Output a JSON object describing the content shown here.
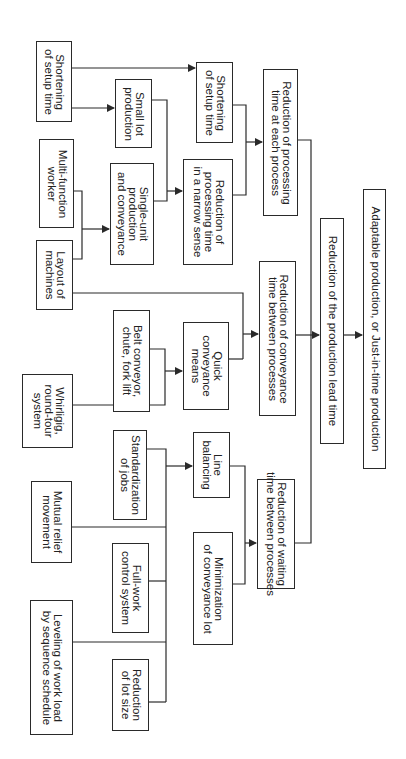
{
  "diagram": {
    "orientation": "rotated-90-clockwise",
    "title": "",
    "colors": {
      "line": "#2a2a2a",
      "text": "#222222",
      "background": "#ffffff"
    },
    "nodes": [
      {
        "id": "shortening_setup_left",
        "label": "Shortening\nof setup time",
        "x": 36,
        "y": 41,
        "w": 36,
        "h": 81
      },
      {
        "id": "small_lot",
        "label": "Small lot\nproduction",
        "x": 115,
        "y": 79,
        "w": 37,
        "h": 69
      },
      {
        "id": "shortening_setup_mid",
        "label": "Shortening\nof setup time",
        "x": 196,
        "y": 62,
        "w": 37,
        "h": 81
      },
      {
        "id": "reduction_processing_each",
        "label": "Reduction of processing\ntime at each process",
        "x": 263,
        "y": 69,
        "w": 35,
        "h": 147
      },
      {
        "id": "multi_function_worker",
        "label": "Multi-function\nworker",
        "x": 39,
        "y": 139,
        "w": 35,
        "h": 89
      },
      {
        "id": "single_unit",
        "label": "Single-unit\nproduction\nand conveyance",
        "x": 110,
        "y": 163,
        "w": 44,
        "h": 102
      },
      {
        "id": "reduction_processing_narrow",
        "label": "Reduction of\nprocessing time\nin a narrow sense",
        "x": 183,
        "y": 159,
        "w": 50,
        "h": 106
      },
      {
        "id": "layout_machines",
        "label": "Layout of\nmachines",
        "x": 36,
        "y": 240,
        "w": 37,
        "h": 70
      },
      {
        "id": "belt_conveyor",
        "label": "Belt conveyor,\nchute, fork lift",
        "x": 113,
        "y": 310,
        "w": 37,
        "h": 102
      },
      {
        "id": "quick_conveyance",
        "label": "Quick\nconveyance\nmeans",
        "x": 183,
        "y": 322,
        "w": 46,
        "h": 88
      },
      {
        "id": "reduction_conveyance",
        "label": "Reduction of conveyance\ntime between processes",
        "x": 259,
        "y": 261,
        "w": 37,
        "h": 155
      },
      {
        "id": "reduction_lead_time",
        "label": "Reduction of the production lead time",
        "x": 320,
        "y": 218,
        "w": 24,
        "h": 226
      },
      {
        "id": "adaptable_production",
        "label": "Adaptable production, or Just-in-time production",
        "x": 363,
        "y": 189,
        "w": 23,
        "h": 280
      },
      {
        "id": "whirligig",
        "label": "Whirligig,\nround-tour\nsystem",
        "x": 22,
        "y": 374,
        "w": 51,
        "h": 74
      },
      {
        "id": "standardization_jobs",
        "label": "Standardization\nof jobs",
        "x": 113,
        "y": 430,
        "w": 34,
        "h": 90
      },
      {
        "id": "line_balancing",
        "label": "Line\nbalancing",
        "x": 193,
        "y": 432,
        "w": 37,
        "h": 66
      },
      {
        "id": "reduction_waiting",
        "label": "Reduction of waiting\ntime between processes",
        "x": 257,
        "y": 479,
        "w": 38,
        "h": 110
      },
      {
        "id": "mutual_relief",
        "label": "Mutual relief\nmovement",
        "x": 31,
        "y": 481,
        "w": 41,
        "h": 82
      },
      {
        "id": "full_work_control",
        "label": "Full-work\ncontrol system",
        "x": 112,
        "y": 543,
        "w": 37,
        "h": 90
      },
      {
        "id": "minimization_conveyance_lot",
        "label": "Minimization\nof conveyance lot",
        "x": 193,
        "y": 532,
        "w": 40,
        "h": 113
      },
      {
        "id": "leveling_work_load",
        "label": "Leveling of work load\nby sequence schedule",
        "x": 30,
        "y": 600,
        "w": 43,
        "h": 135
      },
      {
        "id": "reduction_lot_size",
        "label": "Reduction\nof lot size",
        "x": 112,
        "y": 659,
        "w": 37,
        "h": 72
      }
    ],
    "edges": [
      {
        "from": [
          "shortening_setup_left"
        ],
        "to": "shortening_setup_mid"
      },
      {
        "from": [
          "shortening_setup_left"
        ],
        "to": "small_lot"
      },
      {
        "from": [
          "small_lot",
          "single_unit"
        ],
        "to": "reduction_processing_narrow"
      },
      {
        "from": [
          "multi_function_worker",
          "layout_machines"
        ],
        "to": "single_unit"
      },
      {
        "from": [
          "shortening_setup_mid",
          "reduction_processing_narrow"
        ],
        "to": "reduction_processing_each"
      },
      {
        "from": [
          "layout_machines",
          "quick_conveyance"
        ],
        "to": "reduction_conveyance"
      },
      {
        "from": [
          "belt_conveyor",
          "whirligig"
        ],
        "to": "quick_conveyance"
      },
      {
        "from": [
          "reduction_processing_each",
          "reduction_conveyance",
          "reduction_waiting"
        ],
        "to": "reduction_lead_time"
      },
      {
        "from": [
          "reduction_lead_time"
        ],
        "to": "adaptable_production"
      },
      {
        "from": [
          "standardization_jobs",
          "mutual_relief",
          "full_work_control",
          "leveling_work_load",
          "reduction_lot_size"
        ],
        "to": "line_balancing"
      },
      {
        "from": [
          "line_balancing",
          "minimization_conveyance_lot"
        ],
        "to": "reduction_waiting"
      }
    ]
  }
}
